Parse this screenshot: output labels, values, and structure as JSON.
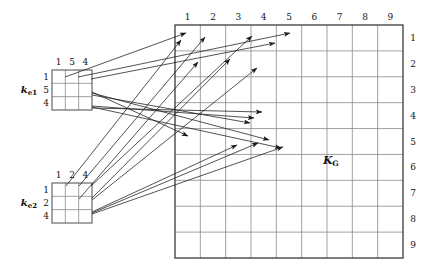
{
  "figure": {
    "kind": "finite-element-stiffness-assembly-diagram",
    "background": "#ffffff",
    "ink": "#141414",
    "gridline_color": "#8a8a8a",
    "border_color": "#3a3a3a",
    "arrow_color": "#1a1a1a"
  },
  "global_matrix": {
    "name_main": "K",
    "name_sub": "G",
    "label_x": 331,
    "label_y": 160,
    "rows": 9,
    "cols": 9,
    "x": 175,
    "y": 25,
    "width": 228,
    "height": 233,
    "col_labels": [
      "1",
      "2",
      "3",
      "4",
      "5",
      "6",
      "7",
      "8",
      "9"
    ],
    "row_labels": [
      "1",
      "2",
      "3",
      "4",
      "5",
      "6",
      "7",
      "8",
      "9"
    ],
    "col_label_y": 17,
    "row_label_x": 413
  },
  "element_matrices": [
    {
      "id": "ke1",
      "name_main": "k",
      "name_sub": "e1",
      "name_x": 29,
      "name_y": 90,
      "x": 52,
      "y": 70,
      "width": 40,
      "height": 40,
      "rows": 3,
      "cols": 3,
      "col_labels": [
        "1",
        "5",
        "4"
      ],
      "row_labels": [
        "1",
        "5",
        "4"
      ],
      "col_label_y": 62,
      "row_label_x": 46,
      "dof_map": [
        1,
        5,
        4
      ]
    },
    {
      "id": "ke2",
      "name_main": "k",
      "name_sub": "e2",
      "name_x": 29,
      "name_y": 203,
      "x": 52,
      "y": 183,
      "width": 40,
      "height": 40,
      "rows": 3,
      "cols": 3,
      "col_labels": [
        "1",
        "2",
        "4"
      ],
      "row_labels": [
        "1",
        "2",
        "4"
      ],
      "col_label_y": 175,
      "row_label_x": 46,
      "dof_map": [
        1,
        2,
        4
      ]
    }
  ],
  "arrows": [
    {
      "id": "e1-r1c1",
      "from_x": 65,
      "from_y": 77,
      "to_x": 186,
      "to_y": 33
    },
    {
      "id": "e1-r1c2",
      "from_x": 78,
      "from_y": 77,
      "to_x": 290,
      "to_y": 33
    },
    {
      "id": "e1-r1c3",
      "from_x": 91,
      "from_y": 79,
      "to_x": 275,
      "to_y": 43
    },
    {
      "id": "e1-r2c1",
      "from_x": 92,
      "from_y": 92,
      "to_x": 188,
      "to_y": 136
    },
    {
      "id": "e1-r2c2",
      "from_x": 92,
      "from_y": 93,
      "to_x": 269,
      "to_y": 140
    },
    {
      "id": "e1-r2c3",
      "from_x": 92,
      "from_y": 95,
      "to_x": 250,
      "to_y": 123
    },
    {
      "id": "e1-r3c1",
      "from_x": 92,
      "from_y": 106,
      "to_x": 254,
      "to_y": 118
    },
    {
      "id": "e1-r3c2",
      "from_x": 92,
      "from_y": 107,
      "to_x": 281,
      "to_y": 148
    },
    {
      "id": "e1-r3c3",
      "from_x": 92,
      "from_y": 108,
      "to_x": 262,
      "to_y": 112
    },
    {
      "id": "e2-r1c1",
      "from_x": 66,
      "from_y": 186,
      "to_x": 181,
      "to_y": 40
    },
    {
      "id": "e2-r1c2",
      "from_x": 79,
      "from_y": 186,
      "to_x": 205,
      "to_y": 37
    },
    {
      "id": "e2-r1c3",
      "from_x": 91,
      "from_y": 186,
      "to_x": 252,
      "to_y": 36
    },
    {
      "id": "e2-r2c1",
      "from_x": 79,
      "from_y": 199,
      "to_x": 198,
      "to_y": 62
    },
    {
      "id": "e2-r2c2",
      "from_x": 92,
      "from_y": 198,
      "to_x": 230,
      "to_y": 59
    },
    {
      "id": "e2-r2c3",
      "from_x": 92,
      "from_y": 200,
      "to_x": 257,
      "to_y": 68
    },
    {
      "id": "e2-r3c1",
      "from_x": 92,
      "from_y": 212,
      "to_x": 237,
      "to_y": 145
    },
    {
      "id": "e2-r3c2",
      "from_x": 92,
      "from_y": 213,
      "to_x": 258,
      "to_y": 143
    },
    {
      "id": "e2-r3c3",
      "from_x": 92,
      "from_y": 214,
      "to_x": 283,
      "to_y": 147
    }
  ]
}
